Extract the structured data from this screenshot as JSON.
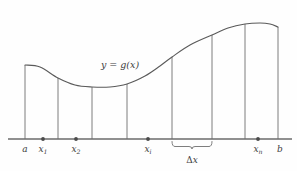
{
  "figure": {
    "background_color": "#fefefe",
    "line_color": "#6f6f6f",
    "curve_color": "#5a5a5a",
    "dot_color": "#4a4a4a",
    "text_color": "#3d3d3d"
  },
  "curve_label": {
    "text": "y = g(x)",
    "lhs": "y",
    "equals": "=",
    "rhs": "g(x)",
    "x": 120,
    "y": 68
  },
  "axis": {
    "y": 139,
    "x_start": 8,
    "x_end": 292
  },
  "brace": {
    "label_delta": "Δ",
    "label_var": "x",
    "label": "Δx",
    "x_left": 172,
    "x_right": 212,
    "label_x": 192,
    "label_y": 163
  },
  "tick_labels": [
    {
      "name": "a",
      "base": "a",
      "sub": "",
      "x": 25,
      "y": 152
    },
    {
      "name": "x1",
      "base": "x",
      "sub": "1",
      "x": 43,
      "y": 152
    },
    {
      "name": "x2",
      "base": "x",
      "sub": "2",
      "x": 76,
      "y": 152
    },
    {
      "name": "xi",
      "base": "x",
      "sub": "i",
      "x": 148,
      "y": 152
    },
    {
      "name": "xn",
      "base": "x",
      "sub": "n",
      "x": 258,
      "y": 152
    },
    {
      "name": "b",
      "base": "b",
      "sub": "",
      "x": 280,
      "y": 152
    }
  ],
  "tick_dots": [
    {
      "name": "dot-x1",
      "x": 43,
      "y": 139,
      "r": 1.9
    },
    {
      "name": "dot-x2",
      "x": 76,
      "y": 139,
      "r": 1.9
    },
    {
      "name": "dot-xi",
      "x": 148,
      "y": 139,
      "r": 1.9
    },
    {
      "name": "dot-xn",
      "x": 258,
      "y": 139,
      "r": 1.9
    }
  ],
  "partition_lines": [
    {
      "name": "partition-a",
      "x": 25,
      "y_top": 65,
      "y_bottom": 139
    },
    {
      "name": "partition-1",
      "x": 58,
      "y_top": 78,
      "y_bottom": 139
    },
    {
      "name": "partition-2",
      "x": 92,
      "y_top": 87,
      "y_bottom": 139
    },
    {
      "name": "partition-3",
      "x": 127,
      "y_top": 84,
      "y_bottom": 139
    },
    {
      "name": "partition-4",
      "x": 172,
      "y_top": 57,
      "y_bottom": 139
    },
    {
      "name": "partition-5",
      "x": 212,
      "y_top": 35,
      "y_bottom": 139
    },
    {
      "name": "partition-6",
      "x": 245,
      "y_top": 24,
      "y_bottom": 139
    },
    {
      "name": "partition-b",
      "x": 278,
      "y_top": 27,
      "y_bottom": 139
    }
  ],
  "chart_data": {
    "type": "line",
    "title": "",
    "xlabel": "",
    "ylabel": "",
    "axis_range_x": [
      8,
      292
    ],
    "axis_range_y_screen": [
      20,
      139
    ],
    "grid": false,
    "legend": false,
    "curve_points": [
      {
        "x": 25,
        "y": 65
      },
      {
        "x": 40,
        "y": 67
      },
      {
        "x": 58,
        "y": 78
      },
      {
        "x": 75,
        "y": 85
      },
      {
        "x": 92,
        "y": 87
      },
      {
        "x": 110,
        "y": 87
      },
      {
        "x": 127,
        "y": 84
      },
      {
        "x": 145,
        "y": 76
      },
      {
        "x": 160,
        "y": 66
      },
      {
        "x": 172,
        "y": 57
      },
      {
        "x": 190,
        "y": 45
      },
      {
        "x": 212,
        "y": 35
      },
      {
        "x": 228,
        "y": 28
      },
      {
        "x": 245,
        "y": 24
      },
      {
        "x": 260,
        "y": 23
      },
      {
        "x": 270,
        "y": 24
      },
      {
        "x": 278,
        "y": 27
      }
    ],
    "partition_x_values": [
      25,
      58,
      92,
      127,
      172,
      212,
      245,
      278
    ],
    "marked_points": [
      "a",
      "x1",
      "x2",
      "xi",
      "xn",
      "b"
    ],
    "annotations": [
      "y = g(x)",
      "Δx"
    ]
  }
}
